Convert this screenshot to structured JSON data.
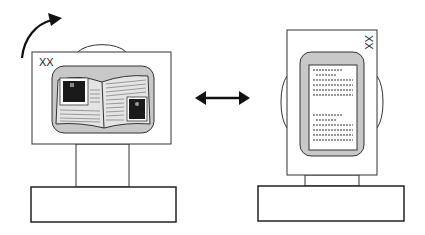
{
  "figure": {
    "left_device": {
      "orientation": "landscape",
      "label": "XX",
      "content": "open-book-with-pictures"
    },
    "right_device": {
      "orientation": "portrait",
      "label": "XX",
      "content": "text-page"
    },
    "rotation_arrow": "curved-arrow-clockwise",
    "transition_arrow": "double-headed-arrow"
  },
  "colors": {
    "stroke": "#333333",
    "screen_fill": "#c8c8c8",
    "page_fill": "#e4e4e4",
    "photo_fill": "#1a1a1a"
  }
}
